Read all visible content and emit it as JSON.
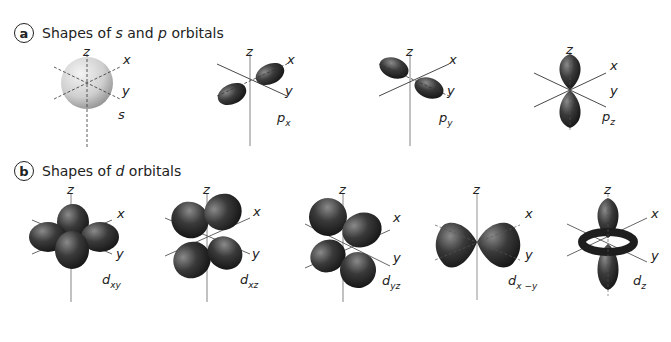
{
  "section_a": {
    "badge": "a",
    "title_pre": "Shapes of ",
    "title_s": "s",
    "title_mid": " and ",
    "title_p": "p",
    "title_post": " orbitals",
    "orbitals": [
      {
        "name": "s",
        "sub": ""
      },
      {
        "name": "p",
        "sub": "x"
      },
      {
        "name": "p",
        "sub": "y"
      },
      {
        "name": "p",
        "sub": "z"
      }
    ]
  },
  "section_b": {
    "badge": "b",
    "title_pre": "Shapes of ",
    "title_d": "d",
    "title_post": " orbitals",
    "orbitals": [
      {
        "name": "d",
        "sub": "xy"
      },
      {
        "name": "d",
        "sub": "xz"
      },
      {
        "name": "d",
        "sub": "yz"
      },
      {
        "name": "d",
        "sub": "x −y"
      },
      {
        "name": "d",
        "sub": "z"
      }
    ]
  },
  "axes": {
    "x": "x",
    "y": "y",
    "z": "z"
  },
  "colors": {
    "lobe_dark": "#1e1e1e",
    "lobe_mid": "#4a4a4a",
    "s_sphere": "#d8d8d8",
    "axis": "#333333"
  }
}
